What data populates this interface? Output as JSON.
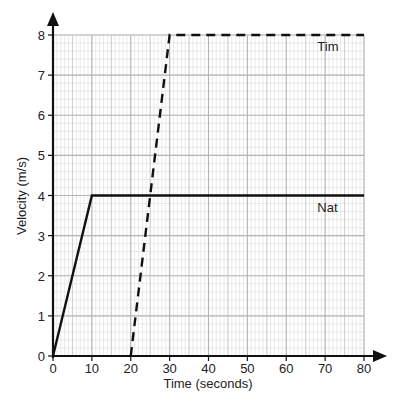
{
  "chart_data": {
    "type": "line",
    "title": "",
    "xlabel": "Time (seconds)",
    "ylabel": "Velocity (m/s)",
    "xlim": [
      0,
      80
    ],
    "ylim": [
      0,
      8
    ],
    "x_ticks": [
      0,
      10,
      20,
      30,
      40,
      50,
      60,
      70,
      80
    ],
    "y_ticks": [
      0,
      1,
      2,
      3,
      4,
      5,
      6,
      7,
      8
    ],
    "grid": true,
    "grid_minor_x": 1,
    "grid_minor_y": 0.2,
    "series": [
      {
        "name": "Nat",
        "style": "solid",
        "x": [
          0,
          10,
          80
        ],
        "y": [
          0,
          4,
          4
        ],
        "label_pos": [
          68,
          3.7
        ]
      },
      {
        "name": "Tim",
        "style": "dashed",
        "x": [
          20,
          30,
          80
        ],
        "y": [
          0,
          8,
          8
        ],
        "label_pos": [
          68,
          7.7
        ]
      }
    ]
  }
}
